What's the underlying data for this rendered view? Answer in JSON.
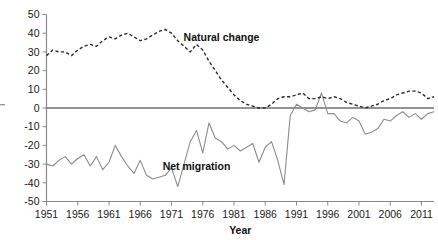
{
  "chart_data": {
    "type": "line",
    "title": "",
    "xlabel": "Year",
    "ylabel": "",
    "xlim": [
      1951,
      2013
    ],
    "ylim": [
      -50,
      50
    ],
    "grid": false,
    "legend_position": "inline-annotation",
    "x_tick_labels": [
      "1951",
      "1956",
      "1961",
      "1966",
      "1971",
      "1976",
      "1981",
      "1986",
      "1991",
      "1996",
      "2001",
      "2006",
      "2011"
    ],
    "x_ticks": [
      1951,
      1956,
      1961,
      1966,
      1971,
      1976,
      1981,
      1986,
      1991,
      1996,
      2001,
      2006,
      2011
    ],
    "y_tick_labels": [
      "50",
      "40",
      "30",
      "20",
      "10",
      "0",
      "-10",
      "-20",
      "-30",
      "-40",
      "-50"
    ],
    "y_ticks": [
      50,
      40,
      30,
      20,
      10,
      0,
      -10,
      -20,
      -30,
      -40,
      -50
    ],
    "annotations": [
      {
        "text": "Natural change",
        "x": 1979,
        "y": 36
      },
      {
        "text": "Net migration",
        "x": 1975,
        "y": -33
      }
    ],
    "x": [
      1951,
      1952,
      1953,
      1954,
      1955,
      1956,
      1957,
      1958,
      1959,
      1960,
      1961,
      1962,
      1963,
      1964,
      1965,
      1966,
      1967,
      1968,
      1969,
      1970,
      1971,
      1972,
      1973,
      1974,
      1975,
      1976,
      1977,
      1978,
      1979,
      1980,
      1981,
      1982,
      1983,
      1984,
      1985,
      1986,
      1987,
      1988,
      1989,
      1990,
      1991,
      1992,
      1993,
      1994,
      1995,
      1996,
      1997,
      1998,
      1999,
      2000,
      2001,
      2002,
      2003,
      2004,
      2005,
      2006,
      2007,
      2008,
      2009,
      2010,
      2011,
      2012,
      2013
    ],
    "series": [
      {
        "name": "Natural change",
        "style": "dashed",
        "color": "#2b2b2b",
        "values": [
          28,
          31,
          30,
          30,
          28,
          31,
          33,
          34,
          33,
          36,
          38,
          37,
          39,
          40,
          38,
          36,
          37,
          39,
          41,
          42,
          40,
          36,
          33,
          30,
          34,
          31,
          25,
          20,
          15,
          11,
          7,
          4,
          2,
          1,
          0,
          0,
          2,
          5,
          6,
          6,
          7,
          8,
          5,
          5,
          6,
          5,
          6,
          5,
          3,
          2,
          1,
          0,
          1,
          2,
          4,
          5,
          7,
          8,
          9,
          9,
          8,
          5,
          6
        ]
      },
      {
        "name": "Net migration",
        "style": "solid",
        "color": "#8c8c8c",
        "values": [
          -30,
          -31,
          -28,
          -26,
          -30,
          -27,
          -25,
          -31,
          -26,
          -33,
          -29,
          -20,
          -26,
          -31,
          -35,
          -28,
          -36,
          -38,
          -37,
          -36,
          -32,
          -42,
          -30,
          -18,
          -12,
          -24,
          -8,
          -16,
          -18,
          -22,
          -20,
          -23,
          -21,
          -19,
          -29,
          -21,
          -18,
          -28,
          -41,
          -4,
          2,
          0,
          -2,
          -1,
          8,
          -3,
          -3,
          -7,
          -8,
          -5,
          -7,
          -14,
          -13,
          -11,
          -6,
          -7,
          -4,
          -2,
          -5,
          -3,
          -6,
          -3,
          -2
        ]
      }
    ]
  }
}
